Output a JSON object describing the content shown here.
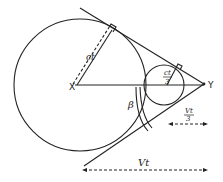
{
  "diagram": {
    "labels": {
      "center_x": "X",
      "point_y": "Y",
      "big_radius": "ct",
      "small_radius_num": "ct",
      "small_radius_den": "3",
      "angle": "β",
      "small_dist_num": "Vt",
      "small_dist_den": "3",
      "big_dist": "Vt"
    },
    "colors": {
      "stroke": "#222222",
      "background": "#ffffff"
    },
    "geometry": {
      "big_circle": {
        "cx": 80,
        "cy": 85,
        "r": 66
      },
      "small_circle": {
        "cx": 164,
        "cy": 85,
        "r": 20
      },
      "point_y": {
        "x": 204,
        "y": 84
      },
      "point_x": {
        "x": 75,
        "y": 86
      }
    }
  }
}
